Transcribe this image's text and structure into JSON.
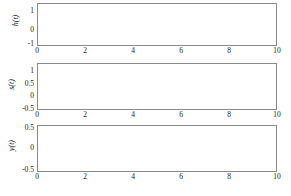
{
  "figure": {
    "background": "#ffffff",
    "axis_color": "#8a8a8a",
    "grid_color": "#9a9a9a",
    "curve_color": "#8c8c8c",
    "text_color": "#1a1a1a"
  },
  "chart_data": [
    {
      "type": "line",
      "title": "",
      "xlabel": "",
      "ylabel": "h(t)",
      "xlim": [
        0,
        10
      ],
      "ylim": [
        -1,
        1.35
      ],
      "xticks": [
        0,
        2,
        4,
        6,
        8,
        10
      ],
      "xticklabels": [
        "0",
        "2",
        "4",
        "6",
        "8",
        "10"
      ],
      "yticks": [
        -1,
        0,
        1
      ],
      "yticklabels": [
        "-1",
        "0",
        "1"
      ],
      "grid": true,
      "series": [
        {
          "name": "h(t)",
          "x": [
            0,
            0.25,
            0.5,
            0.75,
            1,
            1.25,
            1.5,
            1.75,
            2,
            2.5,
            3,
            3.5,
            4,
            4.5,
            5,
            6,
            7,
            8,
            9,
            10
          ],
          "values": [
            1,
            0.779,
            0.607,
            0.472,
            0.368,
            0.287,
            0.223,
            0.174,
            0.135,
            0.082,
            0.05,
            0.03,
            0.018,
            0.011,
            0.0067,
            0.0025,
            0.0009,
            0.0003,
            0.0001,
            0
          ]
        }
      ]
    },
    {
      "type": "line",
      "title": "",
      "xlabel": "",
      "ylabel": "s(t)",
      "xlim": [
        0,
        10
      ],
      "ylim": [
        -0.5,
        1.35
      ],
      "xticks": [
        0,
        2,
        4,
        6,
        8,
        10
      ],
      "xticklabels": [
        "0",
        "2",
        "4",
        "6",
        "8",
        "10"
      ],
      "yticks": [
        -0.5,
        0,
        0.5,
        1
      ],
      "yticklabels": [
        "-0.5",
        "0",
        "0.5",
        "1"
      ],
      "grid": true,
      "series": [
        {
          "name": "s(t)",
          "x": [
            0,
            0.25,
            0.5,
            0.75,
            1,
            1.25,
            1.5,
            1.75,
            2,
            2.5,
            3,
            3.5,
            4,
            4.5,
            5,
            6,
            7,
            8,
            9,
            10
          ],
          "values": [
            0,
            0.221,
            0.393,
            0.528,
            0.632,
            0.713,
            0.777,
            0.826,
            0.865,
            0.918,
            0.95,
            0.97,
            0.982,
            0.989,
            0.993,
            0.998,
            0.999,
            1,
            1,
            1
          ]
        }
      ]
    },
    {
      "type": "line",
      "title": "",
      "xlabel": "",
      "ylabel": "y(t)",
      "xlim": [
        0,
        10
      ],
      "ylim": [
        -0.5,
        0.62
      ],
      "xticks": [
        0,
        2,
        4,
        6,
        8,
        10
      ],
      "xticklabels": [
        "0",
        "2",
        "4",
        "6",
        "8",
        "10"
      ],
      "yticks": [
        -0.5,
        0,
        0.5
      ],
      "yticklabels": [
        "-0.5",
        "0",
        "0.5"
      ],
      "grid": true,
      "series": [
        {
          "name": "y(t)",
          "x": [
            0,
            0.25,
            0.5,
            0.75,
            1,
            1.25,
            1.5,
            2,
            2.5,
            3,
            3.5,
            4,
            4.5,
            5,
            5.5,
            6,
            6.5,
            7,
            8,
            9,
            10
          ],
          "values": [
            0,
            0.195,
            0.303,
            0.354,
            0.368,
            0.359,
            0.335,
            0.271,
            0.205,
            0.149,
            0.106,
            0.073,
            0.05,
            0.034,
            0.022,
            0.015,
            0.009,
            0.006,
            0.002,
            0.001,
            0
          ]
        }
      ]
    }
  ],
  "panels": [
    {
      "name": "impulse-response",
      "ylabel": "h(t)",
      "yticklabels": [
        "1",
        "0",
        "-1"
      ],
      "xticklabels": [
        "0",
        "2",
        "4",
        "6",
        "8",
        "10"
      ]
    },
    {
      "name": "step-response",
      "ylabel": "s(t)",
      "yticklabels": [
        "1",
        "0.5",
        "0",
        "-0.5"
      ],
      "xticklabels": [
        "0",
        "2",
        "4",
        "6",
        "8",
        "10"
      ]
    },
    {
      "name": "output-response",
      "ylabel": "y(t)",
      "yticklabels": [
        "0.5",
        "0",
        "-0.5"
      ],
      "xticklabels": [
        "0",
        "2",
        "4",
        "6",
        "8",
        "10"
      ]
    }
  ]
}
